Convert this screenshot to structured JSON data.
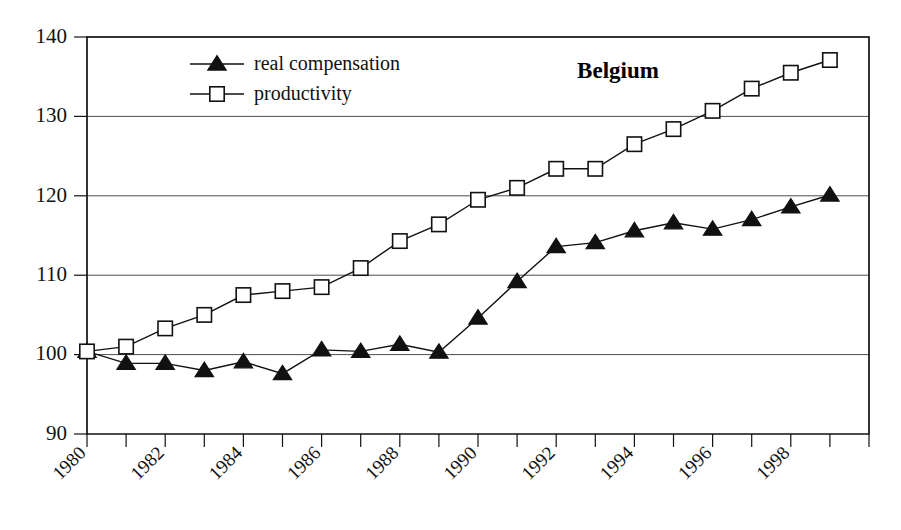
{
  "chart_data": {
    "type": "line",
    "title": "Belgium",
    "xlabel": "",
    "ylabel": "",
    "xlim": [
      1980,
      2000
    ],
    "ylim": [
      90,
      140
    ],
    "grid": true,
    "grid_axis": "y",
    "legend_position": "top-left-inside",
    "y_ticks": [
      90,
      100,
      110,
      120,
      130,
      140
    ],
    "y_tick_labels": [
      "90",
      "100",
      "110",
      "120",
      "130",
      "140"
    ],
    "x_ticks": [
      1980,
      1981,
      1982,
      1983,
      1984,
      1985,
      1986,
      1987,
      1988,
      1989,
      1990,
      1991,
      1992,
      1993,
      1994,
      1995,
      1996,
      1997,
      1998,
      1999,
      2000
    ],
    "x_tick_labels": [
      "1980",
      "",
      "1982",
      "",
      "1984",
      "",
      "1986",
      "",
      "1988",
      "",
      "1990",
      "",
      "1992",
      "",
      "1994",
      "",
      "1996",
      "",
      "1998",
      "",
      ""
    ],
    "x_tick_label_rotation": 45,
    "x": [
      1980,
      1981,
      1982,
      1983,
      1984,
      1985,
      1986,
      1987,
      1988,
      1989,
      1990,
      1991,
      1992,
      1993,
      1994,
      1995,
      1996,
      1997,
      1998,
      1999
    ],
    "series": [
      {
        "name": "real compensation",
        "marker": "filled-triangle",
        "values": [
          100.4,
          98.9,
          98.9,
          98.0,
          99.1,
          97.6,
          100.6,
          100.4,
          101.3,
          100.3,
          104.6,
          109.2,
          113.6,
          114.1,
          115.6,
          116.6,
          115.8,
          117.0,
          118.6,
          120.1
        ]
      },
      {
        "name": "productivity",
        "marker": "open-square",
        "values": [
          100.4,
          101.0,
          103.3,
          105.0,
          107.5,
          108.0,
          108.5,
          110.9,
          114.3,
          116.4,
          119.5,
          121.0,
          123.4,
          123.4,
          126.5,
          128.4,
          130.7,
          133.5,
          135.5,
          137.1
        ]
      }
    ]
  },
  "legend": {
    "entries": [
      {
        "label": "real compensation",
        "marker": "filled-triangle"
      },
      {
        "label": "productivity",
        "marker": "open-square"
      }
    ]
  },
  "colors": {
    "ink": "#111111",
    "grid": "#3a3a3a",
    "background": "#ffffff",
    "marker_fill": "#ffffff"
  }
}
